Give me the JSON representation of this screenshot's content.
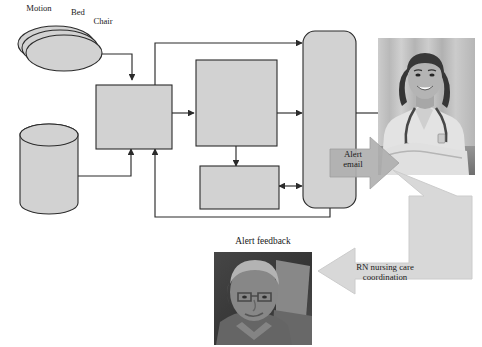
{
  "diagram": {
    "colors": {
      "box_fill": "#d2d2d2",
      "box_stroke": "#2b2b2b",
      "arrow_fill": "#d8d8d8",
      "arrow_stroke": "#c3c3c3",
      "line": "#2b2b2b",
      "text": "#1a1a1a"
    },
    "sensor_labels": [
      {
        "id": "motion",
        "text": "Motion"
      },
      {
        "id": "bed",
        "text": "Bed"
      },
      {
        "id": "chair",
        "text": "Chair"
      }
    ],
    "nodes": {
      "sensors": {
        "label": "Sensors",
        "shape": "stacked-ellipse"
      },
      "ehr": {
        "label": "EHR",
        "shape": "cylinder"
      },
      "integration": {
        "label": "Integration\nand data\nstorage",
        "shape": "rect"
      },
      "detection": {
        "label": "Detection\nand\nrecognition\nof\ndecline",
        "shape": "rect"
      },
      "alert_manager": {
        "label": "Alert\nmanager",
        "shape": "rect"
      },
      "web_portal": {
        "label": "Web\nportal\nand\nmobile\ndevices",
        "shape": "rounded-rect"
      }
    },
    "callouts": {
      "alert_email": {
        "label": "Alert\nemail",
        "shape": "right-arrow"
      },
      "rn_coordination": {
        "label": "RN nursing care\ncoordination",
        "shape": "bent-arrow"
      }
    },
    "captions": {
      "alert_feedback": "Alert feedback"
    },
    "images": {
      "nurse": {
        "alt": "Smiling nurse with stethoscope",
        "tone": "grayscale"
      },
      "elderly_patient": {
        "alt": "Elderly patient seated",
        "tone": "grayscale"
      }
    }
  }
}
